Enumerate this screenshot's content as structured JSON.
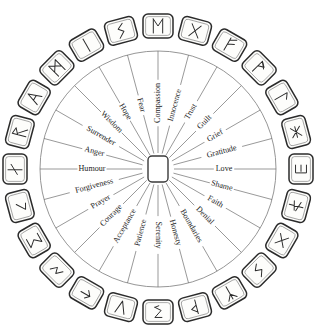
{
  "figure": {
    "type": "radial-diagram",
    "spoke_count": 24,
    "rune_count": 24,
    "background_color": "#ffffff",
    "line_color": "#6d6d6d",
    "ring_color": "#8a8a8a",
    "text_color": "#1a1a1a",
    "tile_stroke_color": "#2b2b2b",
    "tile_fill_color": "#fdfdfb"
  },
  "geometry": {
    "center_x": 158,
    "center_y": 169,
    "hub_width": 20,
    "hub_height": 26,
    "inner_ring_radius": 118,
    "spoke_start_radius": 16,
    "label_radius": 66,
    "rune_radius": 143,
    "rune_tile_width": 30,
    "rune_tile_height": 24,
    "angle_step_degrees": 15,
    "first_spoke_angle_degrees": 0
  },
  "spokes": [
    {
      "index": 0,
      "label": "Love",
      "angle": 0
    },
    {
      "index": 1,
      "label": "Gratitude",
      "angle": 15
    },
    {
      "index": 2,
      "label": "Grief",
      "angle": 30
    },
    {
      "index": 3,
      "label": "Guilt",
      "angle": 45
    },
    {
      "index": 4,
      "label": "Trust",
      "angle": 60
    },
    {
      "index": 5,
      "label": "Innocence",
      "angle": 75
    },
    {
      "index": 6,
      "label": "Compassion",
      "angle": 90
    },
    {
      "index": 7,
      "label": "Fear",
      "angle": 105
    },
    {
      "index": 8,
      "label": "Hope",
      "angle": 120
    },
    {
      "index": 9,
      "label": "Wisdom",
      "angle": 135
    },
    {
      "index": 10,
      "label": "Surrender",
      "angle": 150
    },
    {
      "index": 11,
      "label": "Anger",
      "angle": 165
    },
    {
      "index": 12,
      "label": "Humour",
      "angle": 180
    },
    {
      "index": 13,
      "label": "Forgiveness",
      "angle": 195
    },
    {
      "index": 14,
      "label": "Prayer",
      "angle": 210
    },
    {
      "index": 15,
      "label": "Courage",
      "angle": 225
    },
    {
      "index": 16,
      "label": "Acceptance",
      "angle": 240
    },
    {
      "index": 17,
      "label": "Patience",
      "angle": 255
    },
    {
      "index": 18,
      "label": "Serenity",
      "angle": 270
    },
    {
      "index": 19,
      "label": "Honesty",
      "angle": 285
    },
    {
      "index": 20,
      "label": "Boundaries",
      "angle": 300
    },
    {
      "index": 21,
      "label": "Denial",
      "angle": 315
    },
    {
      "index": 22,
      "label": "Faith",
      "angle": 330
    },
    {
      "index": 23,
      "label": "Shame",
      "angle": 345
    }
  ],
  "runes": [
    {
      "index": 0,
      "name": "rune-tile-love",
      "glyph": "bracket-right",
      "angle": 0
    },
    {
      "index": 1,
      "name": "rune-tile-gratitude",
      "glyph": "x-bar",
      "angle": 15
    },
    {
      "index": 2,
      "name": "rune-tile-grief",
      "glyph": "laguz",
      "angle": 30
    },
    {
      "index": 3,
      "name": "rune-tile-guilt",
      "glyph": "wunjo",
      "angle": 45
    },
    {
      "index": 4,
      "name": "rune-tile-trust",
      "glyph": "fehu",
      "angle": 60
    },
    {
      "index": 5,
      "name": "rune-tile-innocence",
      "glyph": "gebo",
      "angle": 75
    },
    {
      "index": 6,
      "name": "rune-tile-compassion",
      "glyph": "ehwaz",
      "angle": 90
    },
    {
      "index": 7,
      "name": "rune-tile-fear",
      "glyph": "sowilo",
      "angle": 105
    },
    {
      "index": 8,
      "name": "rune-tile-hope",
      "glyph": "isa",
      "angle": 120
    },
    {
      "index": 9,
      "name": "rune-tile-wisdom",
      "glyph": "mannaz",
      "angle": 135
    },
    {
      "index": 10,
      "name": "rune-tile-surrender",
      "glyph": "ansuz",
      "angle": 150
    },
    {
      "index": 11,
      "name": "rune-tile-anger",
      "glyph": "raidho",
      "angle": 165
    },
    {
      "index": 12,
      "name": "rune-tile-humour",
      "glyph": "nauthiz",
      "angle": 180
    },
    {
      "index": 13,
      "name": "rune-tile-forgiveness",
      "glyph": "kenaz",
      "angle": 195
    },
    {
      "index": 14,
      "name": "rune-tile-prayer",
      "glyph": "sigma",
      "angle": 210
    },
    {
      "index": 15,
      "name": "rune-tile-courage",
      "glyph": "zigzag",
      "angle": 225
    },
    {
      "index": 16,
      "name": "rune-tile-acceptance",
      "glyph": "arrow-left",
      "angle": 240
    },
    {
      "index": 17,
      "name": "rune-tile-patience",
      "glyph": "vee",
      "angle": 255
    },
    {
      "index": 18,
      "name": "rune-tile-serenity",
      "glyph": "zed",
      "angle": 270
    },
    {
      "index": 19,
      "name": "rune-tile-honesty",
      "glyph": "thurisaz",
      "angle": 285
    },
    {
      "index": 20,
      "name": "rune-tile-boundaries",
      "glyph": "algiz",
      "angle": 300
    },
    {
      "index": 21,
      "name": "rune-tile-denial",
      "glyph": "jera",
      "angle": 315
    },
    {
      "index": 22,
      "name": "rune-tile-faith",
      "glyph": "inguz-x",
      "angle": 330
    },
    {
      "index": 23,
      "name": "rune-tile-shame",
      "glyph": "ken-star",
      "angle": 345
    }
  ]
}
